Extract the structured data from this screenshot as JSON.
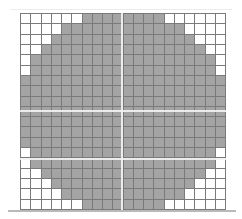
{
  "diagram": {
    "type": "wafer-map-grid",
    "columns": 20,
    "rows": 19,
    "colors": {
      "filled": "#a4a4a4",
      "empty": "#ffffff",
      "gridline": "#7a7a7a",
      "highlight_line": "#f4f4f4"
    },
    "empty_cells_per_row_each_side": [
      6,
      4,
      3,
      2,
      1,
      1,
      0,
      0,
      0,
      0,
      0,
      0,
      0,
      1,
      1,
      2,
      3,
      4,
      6
    ],
    "highlight_lines": {
      "vertical_after_column": 10,
      "horizontal_after_rows": [
        9,
        14
      ]
    }
  }
}
